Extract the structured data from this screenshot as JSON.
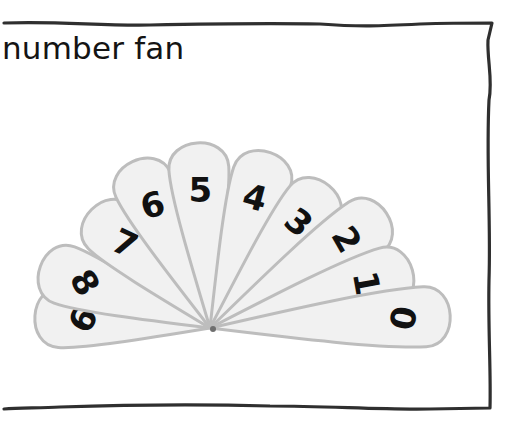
{
  "title": "number fan",
  "fan": {
    "pivot": {
      "x": 210,
      "y": 328
    },
    "fill": "#f1f1f1",
    "stroke": "#bdbdbd",
    "petals": [
      {
        "label": "9",
        "angle": 184,
        "length": 180,
        "numRot": 118
      },
      {
        "label": "8",
        "angle": 200,
        "length": 185,
        "numRot": 60
      },
      {
        "label": "7",
        "angle": 225,
        "length": 172,
        "numRot": 25
      },
      {
        "label": "6",
        "angle": 245,
        "length": 188,
        "numRot": -15
      },
      {
        "label": "5",
        "angle": 266,
        "length": 190,
        "numRot": 0
      },
      {
        "label": "4",
        "angle": 289,
        "length": 190,
        "numRot": 15
      },
      {
        "label": "3",
        "angle": 310,
        "length": 190,
        "numRot": 40
      },
      {
        "label": "2",
        "angle": 327,
        "length": 215,
        "numRot": 60
      },
      {
        "label": "1",
        "angle": 344,
        "length": 215,
        "numRot": 80
      },
      {
        "label": "0",
        "angle": 357,
        "length": 245,
        "numRot": 100
      }
    ]
  }
}
